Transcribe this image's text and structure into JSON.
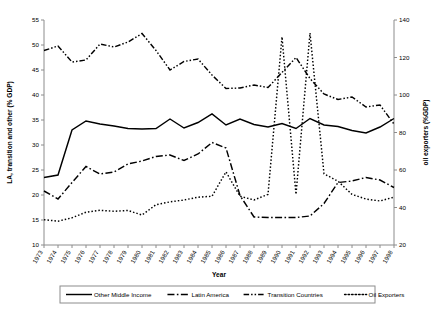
{
  "chart_data": {
    "type": "line",
    "title": "",
    "xlabel": "Year",
    "ylabel_left": "LA, transition and other (% GDP)",
    "ylabel_right": "oil exporters (%GDP)",
    "grid": false,
    "legend_position": "bottom",
    "x": [
      1973,
      1974,
      1975,
      1976,
      1977,
      1978,
      1979,
      1980,
      1981,
      1982,
      1983,
      1984,
      1985,
      1986,
      1987,
      1988,
      1989,
      1990,
      1991,
      1992,
      1993,
      1994,
      1995,
      1996,
      1997,
      1998
    ],
    "xticklabels": [
      "1973",
      "1974",
      "1975",
      "1976",
      "1977",
      "1978",
      "1979",
      "1980",
      "1981",
      "1982",
      "1983",
      "1984",
      "1985",
      "1986",
      "1987",
      "1988",
      "1989",
      "1990",
      "1991",
      "1992",
      "1993",
      "1994",
      "1995",
      "1996",
      "1997",
      "1998"
    ],
    "ylim_left": [
      10,
      55
    ],
    "yticks_left": [
      10,
      15,
      20,
      25,
      30,
      35,
      40,
      45,
      50,
      55
    ],
    "ylim_right": [
      20,
      140
    ],
    "yticks_right": [
      20,
      40,
      60,
      80,
      100,
      120,
      140
    ],
    "series": [
      {
        "name": "Other Middle Income",
        "axis": "left",
        "style": "solid",
        "values": [
          23.5,
          24.0,
          33.0,
          34.8,
          34.2,
          33.8,
          33.3,
          33.2,
          33.3,
          35.2,
          33.4,
          34.5,
          36.2,
          34.0,
          35.2,
          34.1,
          33.6,
          34.3,
          33.3,
          35.3,
          34.0,
          33.7,
          32.9,
          32.4,
          33.6,
          35.3
        ]
      },
      {
        "name": "Latin America",
        "axis": "left",
        "style": "longdash-dot",
        "values": [
          20.8,
          19.2,
          22.5,
          25.7,
          24.2,
          24.6,
          26.2,
          26.8,
          27.7,
          28.0,
          26.9,
          28.2,
          30.5,
          29.4,
          19.9,
          15.6,
          15.5,
          15.5,
          15.5,
          15.8,
          18.3,
          22.5,
          22.8,
          23.5,
          23.0,
          21.5
        ]
      },
      {
        "name": "Transition Countries",
        "axis": "left",
        "style": "dash-dot-dot",
        "values": [
          48.9,
          49.8,
          46.6,
          47.0,
          50.2,
          49.6,
          50.6,
          52.3,
          48.9,
          45.0,
          46.7,
          47.2,
          44.0,
          41.3,
          41.4,
          42.0,
          41.5,
          44.5,
          47.5,
          43.3,
          40.2,
          39.1,
          39.6,
          37.6,
          38.0,
          34.2
        ]
      },
      {
        "name": "Oil Exporters",
        "axis": "right",
        "style": "dotted",
        "values": [
          33.5,
          32.7,
          34.5,
          37.5,
          38.5,
          38.0,
          38.4,
          36.0,
          41.5,
          43.0,
          44.0,
          45.5,
          46.0,
          59.0,
          46.0,
          44.0,
          47.0,
          131.0,
          47.0,
          133.0,
          58.0,
          54.0,
          47.0,
          44.5,
          43.5,
          45.5
        ]
      }
    ]
  },
  "legend": {
    "items": [
      {
        "label": "Other Middle Income",
        "style": "solid"
      },
      {
        "label": "Latin America",
        "style": "longdash-dot"
      },
      {
        "label": "Transition Countries",
        "style": "dash-dot-dot"
      },
      {
        "label": "Oil Exporters",
        "style": "dotted"
      }
    ]
  }
}
